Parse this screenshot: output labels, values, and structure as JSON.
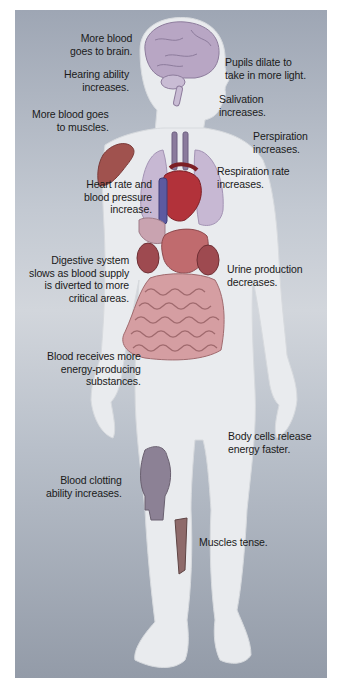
{
  "figure": {
    "colors": {
      "background_top": "#9ea6b4",
      "background_mid": "#d2d6dc",
      "background_bottom": "#939ba8",
      "body": "#e9ebee",
      "brain": "#b8a6c4",
      "heart": "#b2323a",
      "lungs": "#c7b8d3",
      "muscle": "#a0524e",
      "digestive": "#c58a8f",
      "kidney": "#9e4a50",
      "knee": "#8c8195"
    },
    "labels": [
      {
        "id": "brain",
        "text": "More blood\ngoes to brain."
      },
      {
        "id": "hearing",
        "text": "Hearing ability\nincreases."
      },
      {
        "id": "muscles-blood",
        "text": "More blood goes\nto muscles."
      },
      {
        "id": "heart",
        "text": "Heart rate and\nblood pressure\nincrease."
      },
      {
        "id": "digestive",
        "text": "Digestive system\nslows as blood supply\nis diverted to more\ncritical areas."
      },
      {
        "id": "energy-substances",
        "text": "Blood receives more\nenergy-producing\nsubstances."
      },
      {
        "id": "clotting",
        "text": "Blood clotting\nability increases."
      },
      {
        "id": "pupils",
        "text": "Pupils dilate to\ntake in more light."
      },
      {
        "id": "salivation",
        "text": "Salivation\nincreases."
      },
      {
        "id": "perspiration",
        "text": "Perspiration\nincreases."
      },
      {
        "id": "respiration",
        "text": "Respiration rate\nincreases."
      },
      {
        "id": "urine",
        "text": "Urine production\ndecreases."
      },
      {
        "id": "body-cells",
        "text": "Body cells release\nenergy faster."
      },
      {
        "id": "muscles-tense",
        "text": "Muscles tense."
      }
    ]
  }
}
